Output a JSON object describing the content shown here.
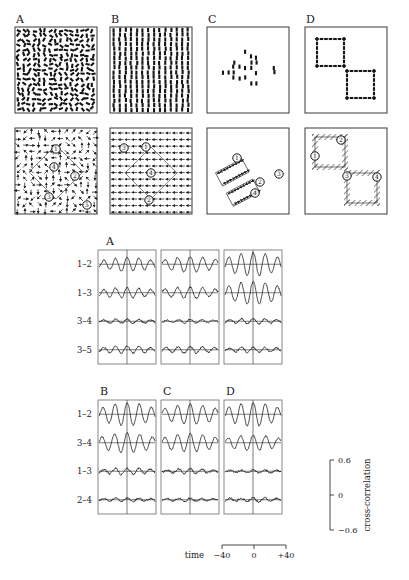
{
  "figure": {
    "top_panels": [
      {
        "letter": "A",
        "stimulus": "random-orientation-dashes",
        "field": "random-directions"
      },
      {
        "letter": "B",
        "stimulus": "vertical-dashes-uniform",
        "field": "uniform-leftward"
      },
      {
        "letter": "C",
        "stimulus": "diamond-cluster-dashes",
        "field": "two-rotated-rectangles"
      },
      {
        "letter": "D",
        "stimulus": "two-dashed-squares",
        "field": "two-hatched-squares"
      }
    ],
    "rf_labels": {
      "A": [
        "1",
        "4",
        "2",
        "3",
        "5"
      ],
      "B": [
        "3",
        "1",
        "4",
        "2"
      ],
      "C": [
        "1",
        "2",
        "3",
        "4"
      ],
      "D": [
        "2",
        "1",
        "3",
        "4"
      ]
    }
  },
  "correlograms": {
    "block_top": {
      "letter": "A",
      "row_labels": [
        "1–2",
        "1–3",
        "3–4",
        "3–5"
      ],
      "n_columns": 3
    },
    "block_bottom": {
      "letters": [
        "B",
        "C",
        "D"
      ],
      "row_labels": [
        "1–2",
        "3–4",
        "1–3",
        "2–4"
      ]
    },
    "yaxis": {
      "title": "cross-correlation",
      "ticks": [
        "0.6",
        "0",
        "−0.6"
      ],
      "range": [
        -0.6,
        0.6
      ]
    },
    "xaxis": {
      "title": "time",
      "ticks": [
        "−40",
        "0",
        "+40"
      ],
      "range": [
        -40,
        40
      ],
      "unit": "ms"
    }
  },
  "chart_data": {
    "type": "line",
    "xlabel": "time",
    "ylabel": "cross-correlation",
    "xlim": [
      -60,
      60
    ],
    "ylim": [
      -0.6,
      0.6
    ],
    "grid": false,
    "legend": "none",
    "xticks": [
      -40,
      0,
      40
    ],
    "yticks": [
      -0.6,
      0,
      0.6
    ],
    "blocks": [
      {
        "letter": "A",
        "columns": [
          {
            "index": 1,
            "rows": [
              {
                "pair": "1–2",
                "amplitude": 0.3,
                "period": 25,
                "phase": 0,
                "noise": 0.05
              },
              {
                "pair": "1–3",
                "amplitude": 0.22,
                "period": 25,
                "phase": 0,
                "noise": 0.06
              },
              {
                "pair": "3–4",
                "amplitude": 0.09,
                "period": 25,
                "phase": 0,
                "noise": 0.06
              },
              {
                "pair": "3–5",
                "amplitude": 0.16,
                "period": 25,
                "phase": 0,
                "noise": 0.06
              }
            ]
          },
          {
            "index": 2,
            "rows": [
              {
                "pair": "1–2",
                "amplitude": 0.34,
                "period": 27,
                "phase": 0,
                "noise": 0.05
              },
              {
                "pair": "1–3",
                "amplitude": 0.26,
                "period": 27,
                "phase": 0,
                "noise": 0.06
              },
              {
                "pair": "3–4",
                "amplitude": 0.08,
                "period": 25,
                "phase": 0,
                "noise": 0.05
              },
              {
                "pair": "3–5",
                "amplitude": 0.15,
                "period": 26,
                "phase": 0,
                "noise": 0.06
              }
            ]
          },
          {
            "index": 3,
            "rows": [
              {
                "pair": "1–2",
                "amplitude": 0.52,
                "period": 26,
                "phase": 0,
                "noise": 0.05
              },
              {
                "pair": "1–3",
                "amplitude": 0.5,
                "period": 26,
                "phase": 0,
                "noise": 0.06
              },
              {
                "pair": "3–4",
                "amplitude": 0.12,
                "period": 25,
                "phase": 0,
                "noise": 0.06
              },
              {
                "pair": "3–5",
                "amplitude": 0.12,
                "period": 25,
                "phase": 0,
                "noise": 0.06
              }
            ]
          }
        ]
      },
      {
        "letter": "B",
        "columns": [
          {
            "index": 1,
            "rows": [
              {
                "pair": "1–2",
                "amplitude": 0.5,
                "period": 26,
                "phase": 0,
                "noise": 0.05
              },
              {
                "pair": "3–4",
                "amplitude": 0.44,
                "period": 27,
                "phase": 0,
                "noise": 0.05
              },
              {
                "pair": "1–3",
                "amplitude": 0.14,
                "period": 25,
                "phase": 0,
                "noise": 0.07
              },
              {
                "pair": "2–4",
                "amplitude": 0.08,
                "period": 25,
                "phase": 0,
                "noise": 0.06
              }
            ]
          }
        ]
      },
      {
        "letter": "C",
        "columns": [
          {
            "index": 1,
            "rows": [
              {
                "pair": "1–2",
                "amplitude": 0.44,
                "period": 27,
                "phase": 0,
                "noise": 0.05
              },
              {
                "pair": "3–4",
                "amplitude": 0.4,
                "period": 27,
                "phase": 0,
                "noise": 0.05
              },
              {
                "pair": "1–3",
                "amplitude": 0.1,
                "period": 25,
                "phase": 0,
                "noise": 0.07
              },
              {
                "pair": "2–4",
                "amplitude": 0.07,
                "period": 25,
                "phase": 0,
                "noise": 0.06
              }
            ]
          }
        ]
      },
      {
        "letter": "D",
        "columns": [
          {
            "index": 1,
            "rows": [
              {
                "pair": "1–2",
                "amplitude": 0.52,
                "period": 26,
                "phase": 0,
                "noise": 0.05
              },
              {
                "pair": "3–4",
                "amplitude": 0.34,
                "period": 27,
                "phase": 0,
                "noise": 0.05
              },
              {
                "pair": "1–3",
                "amplitude": 0.07,
                "period": 25,
                "phase": 0,
                "noise": 0.06
              },
              {
                "pair": "2–4",
                "amplitude": 0.09,
                "period": 25,
                "phase": 0,
                "noise": 0.07
              }
            ]
          }
        ]
      }
    ]
  }
}
